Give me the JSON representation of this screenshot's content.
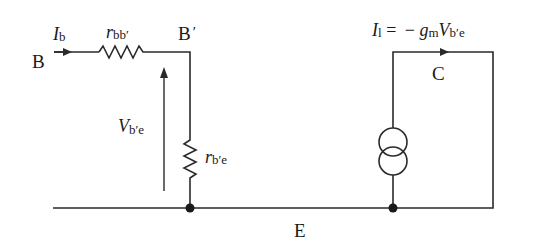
{
  "diagram": {
    "type": "circuit",
    "nodes": {
      "base": {
        "label": "B"
      },
      "internal_base": {
        "label": "B",
        "prime": "′"
      },
      "collector": {
        "label": "C"
      },
      "emitter": {
        "label": "E"
      }
    },
    "components": {
      "base_spreading_resistor": {
        "symbol": "r",
        "subscript": "bb′"
      },
      "base_emitter_resistor": {
        "symbol": "r",
        "subscript": "b′e"
      },
      "controlled_current_source": {
        "expression_lhs": "I",
        "lhs_subscript": "l",
        "equals": " = ",
        "minus": "− ",
        "gain": "g",
        "gain_subscript": "m",
        "voltage": "V",
        "voltage_subscript": "b′e"
      }
    },
    "annotations": {
      "base_current": {
        "symbol": "I",
        "subscript": "b"
      },
      "base_emitter_voltage": {
        "symbol": "V",
        "subscript": "b′e"
      }
    }
  },
  "colors": {
    "line": "#2a2a2a",
    "text": "#1a1a1a",
    "background": "#ffffff"
  }
}
